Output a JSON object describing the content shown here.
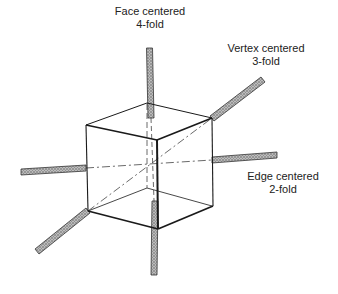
{
  "diagram": {
    "type": "cube-rotation-axes",
    "colors": {
      "edge": "#1a1a1a",
      "hidden": "#444444",
      "rod_fill": "#a8a8a8",
      "rod_stroke": "#333333",
      "text": "#222222"
    },
    "labels": {
      "face": {
        "line1": "Face centered",
        "line2": "4-fold"
      },
      "vertex": {
        "line1": "Vertex centered",
        "line2": "3-fold"
      },
      "edge": {
        "line1": "Edge centered",
        "line2": "2-fold"
      }
    },
    "axes": [
      {
        "name": "Face centered",
        "fold": "4-fold"
      },
      {
        "name": "Vertex centered",
        "fold": "3-fold"
      },
      {
        "name": "Edge centered",
        "fold": "2-fold"
      }
    ]
  }
}
